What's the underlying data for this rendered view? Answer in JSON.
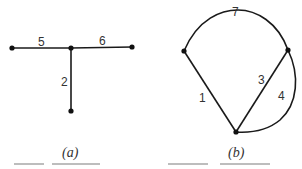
{
  "figure": {
    "panels": [
      {
        "id": "a",
        "caption": "(a)",
        "edge_labels": {
          "left": "5",
          "right": "6",
          "down": "2"
        }
      },
      {
        "id": "b",
        "caption": "(b)",
        "edge_labels": {
          "top_arc": "7",
          "diag_left": "1",
          "diag_right": "3",
          "right_arc": "4"
        }
      }
    ]
  }
}
